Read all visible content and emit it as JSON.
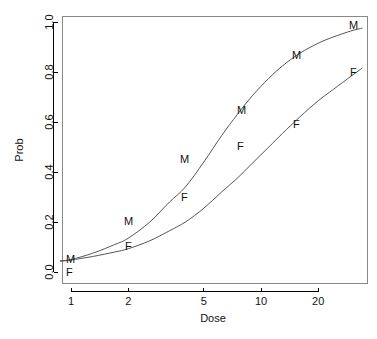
{
  "chart_data": {
    "type": "line",
    "title": "",
    "subtitle": "",
    "xlabel": "Dose",
    "ylabel": "Prob",
    "xscale": "log",
    "yscale": "linear",
    "xlim": [
      0.88,
      34
    ],
    "ylim": [
      0.0,
      1.0
    ],
    "grid": false,
    "legend": "none",
    "x_ticks": [
      {
        "value": 1,
        "label": "1"
      },
      {
        "value": 2,
        "label": "2"
      },
      {
        "value": 5,
        "label": "5"
      },
      {
        "value": 10,
        "label": "10"
      },
      {
        "value": 20,
        "label": "20"
      }
    ],
    "y_ticks": [
      {
        "value": 0.0,
        "label": "0.0"
      },
      {
        "value": 0.2,
        "label": "0.2"
      },
      {
        "value": 0.4,
        "label": "0.4"
      },
      {
        "value": 0.6,
        "label": "0.6"
      },
      {
        "value": 0.8,
        "label": "0.8"
      },
      {
        "value": 1.0,
        "label": "1.0"
      }
    ],
    "series": [
      {
        "name": "M",
        "marker_label": "M",
        "x": [
          1,
          2,
          4,
          8,
          16,
          30
        ],
        "y": [
          0.05,
          0.2,
          0.45,
          0.68,
          0.9,
          0.98
        ]
      },
      {
        "name": "F",
        "marker_label": "F",
        "x": [
          1,
          2,
          4,
          8,
          16,
          30
        ],
        "y": [
          0.02,
          0.1,
          0.29,
          0.51,
          0.7,
          0.82
        ]
      }
    ],
    "curves": [
      {
        "name": "M",
        "points_x": [
          0.88,
          1,
          1.3,
          1.7,
          2,
          2.6,
          3.3,
          4,
          5,
          6.2,
          7.5,
          9,
          11,
          13,
          16,
          20,
          24,
          30,
          34
        ],
        "points_y": [
          0.045,
          0.05,
          0.075,
          0.11,
          0.135,
          0.2,
          0.28,
          0.34,
          0.44,
          0.545,
          0.63,
          0.705,
          0.775,
          0.825,
          0.875,
          0.915,
          0.94,
          0.965,
          0.975
        ]
      },
      {
        "name": "F",
        "points_x": [
          0.88,
          1,
          1.3,
          1.7,
          2,
          2.6,
          3.3,
          4,
          5,
          6.2,
          7.5,
          9,
          11,
          13,
          16,
          20,
          24,
          30,
          34
        ],
        "points_y": [
          0.043,
          0.048,
          0.062,
          0.08,
          0.093,
          0.125,
          0.165,
          0.2,
          0.255,
          0.32,
          0.375,
          0.435,
          0.5,
          0.555,
          0.62,
          0.685,
          0.73,
          0.785,
          0.815
        ]
      }
    ],
    "point_labels": [
      {
        "text": "M",
        "x": 1,
        "y": 0.05,
        "px": 66,
        "py": 263
      },
      {
        "text": "F",
        "x": 1,
        "y": 0.02,
        "px": 66,
        "py": 276
      },
      {
        "text": "M",
        "x": 2,
        "y": 0.2,
        "px": 124,
        "py": 225
      },
      {
        "text": "F",
        "x": 2,
        "y": 0.1,
        "px": 125,
        "py": 250
      },
      {
        "text": "M",
        "x": 4,
        "y": 0.45,
        "px": 180,
        "py": 163
      },
      {
        "text": "F",
        "x": 4,
        "y": 0.29,
        "px": 181,
        "py": 201
      },
      {
        "text": "M",
        "x": 8,
        "y": 0.68,
        "px": 237,
        "py": 114
      },
      {
        "text": "F",
        "x": 8,
        "y": 0.51,
        "px": 237,
        "py": 150
      },
      {
        "text": "M",
        "x": 16,
        "y": 0.9,
        "px": 292,
        "py": 59
      },
      {
        "text": "F",
        "x": 16,
        "y": 0.7,
        "px": 293,
        "py": 128
      },
      {
        "text": "M",
        "x": 30,
        "y": 0.98,
        "px": 349,
        "py": 29
      },
      {
        "text": "F",
        "x": 30,
        "y": 0.82,
        "px": 350,
        "py": 76
      }
    ],
    "colors": {
      "curve": "#555555",
      "axis": "#000000",
      "frame": "#888888",
      "text": "#111111",
      "background": "#ffffff"
    }
  },
  "geometry": {
    "plot_left": 62,
    "plot_right": 367,
    "plot_top": 16,
    "plot_bottom": 283,
    "y_zero_px": 272,
    "y_one_px": 22,
    "x_one_px": 71,
    "px_per_decade": 190
  },
  "labels": {
    "x_axis_title": "Dose",
    "y_axis_title": "Prob"
  }
}
